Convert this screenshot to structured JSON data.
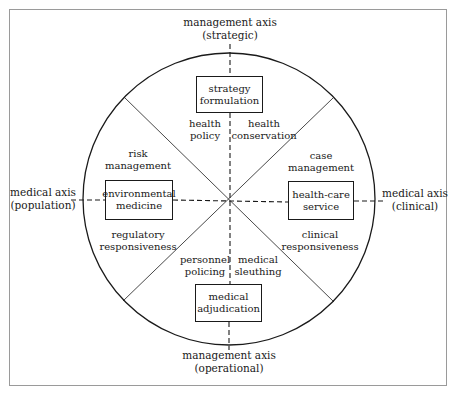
{
  "diagram": {
    "axes": {
      "top": {
        "line1": "management axis",
        "line2": "(strategic)"
      },
      "bottom": {
        "line1": "management axis",
        "line2": "(operational)"
      },
      "left": {
        "line1": "medical axis",
        "line2": "(population)"
      },
      "right": {
        "line1": "medical axis",
        "line2": "(clinical)"
      }
    },
    "boxes": {
      "top": {
        "line1": "strategy",
        "line2": "formulation"
      },
      "left": {
        "line1": "environmental",
        "line2": "medicine"
      },
      "right": {
        "line1": "health-care",
        "line2": "service"
      },
      "bottom": {
        "line1": "medical",
        "line2": "adjudication"
      }
    },
    "sectors": {
      "top_left": {
        "line1": "health",
        "line2": "policy"
      },
      "top_right": {
        "line1": "health",
        "line2": "conservation"
      },
      "left_upper": {
        "line1": "risk",
        "line2": "management"
      },
      "right_upper": {
        "line1": "case",
        "line2": "management"
      },
      "left_lower": {
        "line1": "regulatory",
        "line2": "responsiveness"
      },
      "right_lower": {
        "line1": "clinical",
        "line2": "responsiveness"
      },
      "bottom_left": {
        "line1": "personnel",
        "line2": "policing"
      },
      "bottom_right": {
        "line1": "medical",
        "line2": "sleuthing"
      }
    },
    "colors": {
      "line": "#1a1a1a",
      "frame": "#9a9a9a",
      "background": "#ffffff"
    }
  }
}
